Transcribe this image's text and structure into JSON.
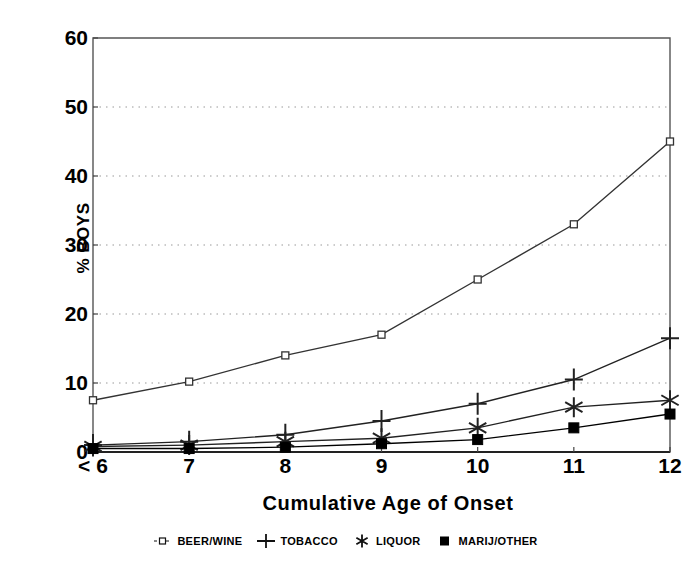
{
  "chart_data": {
    "type": "line",
    "title": "",
    "xlabel": "Cumulative Age of Onset",
    "ylabel": "% BOYS",
    "categories": [
      "< 6",
      "7",
      "8",
      "9",
      "10",
      "11",
      "12"
    ],
    "ylim": [
      0,
      60
    ],
    "yticks": [
      0,
      10,
      20,
      30,
      40,
      50,
      60
    ],
    "ytick_labels": [
      "0",
      "10",
      "20",
      "30",
      "40",
      "50",
      "60"
    ],
    "grid": "horizontal-dotted",
    "legend_position": "bottom",
    "series": [
      {
        "name": "BEER/WINE",
        "marker": "open-square",
        "color": "#333333",
        "values": [
          7.5,
          10.2,
          14.0,
          17.0,
          25.0,
          33.0,
          45.0
        ]
      },
      {
        "name": "TOBACCO",
        "marker": "plus",
        "color": "#222222",
        "values": [
          1.0,
          1.5,
          2.5,
          4.5,
          7.0,
          10.5,
          16.5
        ]
      },
      {
        "name": "LIQUOR",
        "marker": "asterisk",
        "color": "#222222",
        "values": [
          0.8,
          1.0,
          1.5,
          2.0,
          3.5,
          6.5,
          7.5
        ]
      },
      {
        "name": "MARIJ/OTHER",
        "marker": "filled-square",
        "color": "#000000",
        "values": [
          0.5,
          0.5,
          0.7,
          1.2,
          1.8,
          3.5,
          5.5
        ]
      }
    ]
  },
  "axes": {
    "y_title": "% BOYS",
    "x_title": "Cumulative Age of Onset"
  },
  "legend": {
    "items": [
      {
        "label": "BEER/WINE",
        "marker": "open-square-with-line-icon"
      },
      {
        "label": "TOBACCO",
        "marker": "plus-icon"
      },
      {
        "label": "LIQUOR",
        "marker": "asterisk-icon"
      },
      {
        "label": "MARIJ/OTHER",
        "marker": "filled-square-icon"
      }
    ]
  }
}
